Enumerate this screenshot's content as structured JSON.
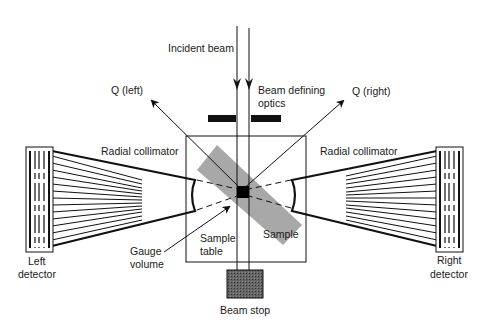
{
  "diagram": {
    "labels": {
      "incident_beam": "Incident beam",
      "beam_defining_optics_line1": "Beam defining",
      "beam_defining_optics_line2": "optics",
      "q_left": "Q (left)",
      "q_right": "Q (right)",
      "radial_collimator_left": "Radial collimator",
      "radial_collimator_right": "Radial collimator",
      "left_detector_line1": "Left",
      "left_detector_line2": "detector",
      "right_detector_line1": "Right",
      "right_detector_line2": "detector",
      "gauge_volume_line1": "Gauge",
      "gauge_volume_line2": "volume",
      "sample_table_line1": "Sample",
      "sample_table_line2": "table",
      "sample": "Sample",
      "beam_stop": "Beam stop"
    },
    "colors": {
      "line": "#111111",
      "sample_fill": "#a8a8a8",
      "beam_stop_fill": "#555555",
      "gauge_fill": "#000000"
    }
  }
}
